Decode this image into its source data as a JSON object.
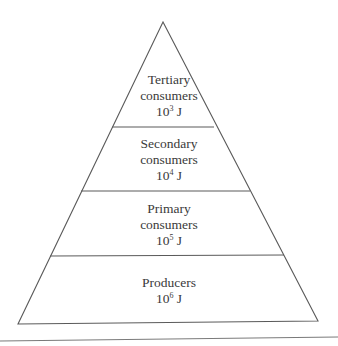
{
  "diagram": {
    "type": "energy-pyramid",
    "levels": [
      {
        "name_line1": "Tertiary",
        "name_line2": "consumers",
        "energy_base": "10",
        "energy_exp": "3",
        "energy_unit": " J"
      },
      {
        "name_line1": "Secondary",
        "name_line2": "consumers",
        "energy_base": "10",
        "energy_exp": "4",
        "energy_unit": " J"
      },
      {
        "name_line1": "Primary",
        "name_line2": "consumers",
        "energy_base": "10",
        "energy_exp": "5",
        "energy_unit": " J"
      },
      {
        "name_line1": "Producers",
        "name_line2": "",
        "energy_base": "10",
        "energy_exp": "6",
        "energy_unit": " J"
      }
    ],
    "colors": {
      "line": "#5a5a5a",
      "text": "#3a3a3a",
      "background": "#ffffff"
    }
  }
}
